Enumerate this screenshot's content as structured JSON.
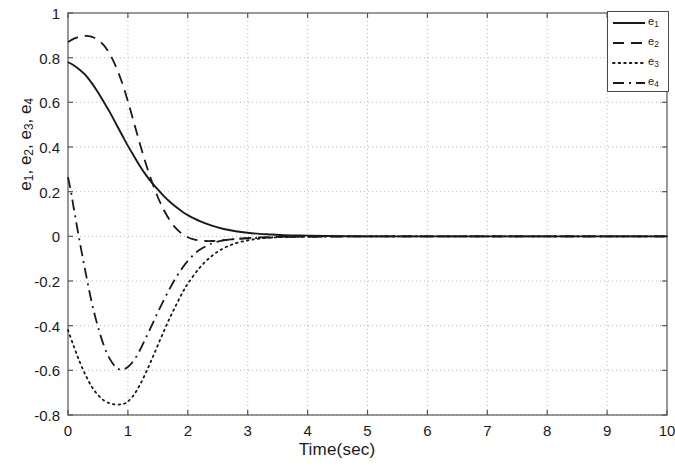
{
  "chart_data": {
    "type": "line",
    "title": "",
    "xlabel": "Time(sec)",
    "ylabel": "e_1, e_2, e_3, e_4",
    "xlim": [
      0,
      10
    ],
    "ylim": [
      -0.8,
      1
    ],
    "xticks": [
      "0",
      "1",
      "2",
      "3",
      "4",
      "5",
      "6",
      "7",
      "8",
      "9",
      "10"
    ],
    "yticks": [
      "1",
      "0.8",
      "0.6",
      "0.4",
      "0.2",
      "0",
      "-0.2",
      "-0.4",
      "-0.6",
      "-0.8"
    ],
    "grid": true,
    "grid_style": "dotted",
    "grid_color": "#b9b9b9",
    "legend_position": "top-right",
    "line_color": "#1a1a1a",
    "series": [
      {
        "name": "e_1",
        "label_base": "e",
        "label_sub": "1",
        "style": "solid",
        "x": [
          0,
          0.1,
          0.2,
          0.3,
          0.4,
          0.5,
          0.6,
          0.7,
          0.8,
          0.9,
          1.0,
          1.1,
          1.2,
          1.3,
          1.4,
          1.5,
          1.6,
          1.7,
          1.8,
          1.9,
          2.0,
          2.2,
          2.4,
          2.6,
          2.8,
          3.0,
          3.2,
          3.4,
          3.6,
          3.8,
          4.0,
          4.5,
          5.0,
          6.0,
          7.0,
          8.0,
          9.0,
          10.0
        ],
        "y": [
          0.78,
          0.765,
          0.745,
          0.72,
          0.685,
          0.645,
          0.6,
          0.555,
          0.505,
          0.455,
          0.405,
          0.36,
          0.315,
          0.275,
          0.24,
          0.21,
          0.18,
          0.155,
          0.132,
          0.112,
          0.095,
          0.068,
          0.048,
          0.033,
          0.023,
          0.016,
          0.011,
          0.008,
          0.005,
          0.004,
          0.003,
          0.001,
          0.0,
          0.0,
          0.0,
          0.0,
          0.0,
          0.0
        ]
      },
      {
        "name": "e_2",
        "label_base": "e",
        "label_sub": "2",
        "style": "dashed",
        "x": [
          0,
          0.1,
          0.2,
          0.3,
          0.4,
          0.5,
          0.6,
          0.7,
          0.8,
          0.9,
          1.0,
          1.1,
          1.2,
          1.3,
          1.4,
          1.5,
          1.6,
          1.7,
          1.8,
          1.9,
          2.0,
          2.1,
          2.2,
          2.3,
          2.4,
          2.5,
          2.6,
          2.8,
          3.0,
          3.2,
          3.5,
          4.0,
          5.0,
          6.0,
          8.0,
          10.0
        ],
        "y": [
          0.87,
          0.885,
          0.895,
          0.898,
          0.893,
          0.88,
          0.855,
          0.815,
          0.76,
          0.69,
          0.605,
          0.51,
          0.415,
          0.325,
          0.245,
          0.175,
          0.118,
          0.072,
          0.037,
          0.012,
          -0.004,
          -0.014,
          -0.019,
          -0.021,
          -0.021,
          -0.019,
          -0.017,
          -0.012,
          -0.008,
          -0.005,
          -0.002,
          -0.001,
          0.0,
          0.0,
          0.0,
          0.0
        ]
      },
      {
        "name": "e_3",
        "label_base": "e",
        "label_sub": "3",
        "style": "dotted",
        "x": [
          0,
          0.1,
          0.2,
          0.3,
          0.4,
          0.5,
          0.6,
          0.7,
          0.8,
          0.9,
          0.95,
          1.0,
          1.1,
          1.2,
          1.3,
          1.4,
          1.5,
          1.6,
          1.7,
          1.8,
          1.9,
          2.0,
          2.2,
          2.4,
          2.6,
          2.8,
          3.0,
          3.2,
          3.5,
          4.0,
          5.0,
          6.0,
          8.0,
          10.0
        ],
        "y": [
          -0.42,
          -0.495,
          -0.565,
          -0.625,
          -0.675,
          -0.71,
          -0.735,
          -0.748,
          -0.753,
          -0.752,
          -0.748,
          -0.74,
          -0.71,
          -0.665,
          -0.61,
          -0.55,
          -0.487,
          -0.425,
          -0.365,
          -0.31,
          -0.258,
          -0.212,
          -0.14,
          -0.088,
          -0.053,
          -0.031,
          -0.018,
          -0.01,
          -0.004,
          -0.001,
          0.0,
          0.0,
          0.0,
          0.0
        ]
      },
      {
        "name": "e_4",
        "label_base": "e",
        "label_sub": "4",
        "style": "dashdot",
        "x": [
          0,
          0.05,
          0.1,
          0.2,
          0.3,
          0.4,
          0.5,
          0.6,
          0.7,
          0.8,
          0.85,
          0.9,
          1.0,
          1.1,
          1.2,
          1.3,
          1.4,
          1.5,
          1.6,
          1.7,
          1.8,
          1.9,
          2.0,
          2.1,
          2.2,
          2.4,
          2.6,
          2.8,
          3.0,
          3.2,
          3.5,
          4.0,
          5.0,
          6.0,
          8.0,
          10.0
        ],
        "y": [
          0.265,
          0.2,
          0.12,
          -0.03,
          -0.17,
          -0.3,
          -0.405,
          -0.49,
          -0.55,
          -0.587,
          -0.595,
          -0.597,
          -0.585,
          -0.555,
          -0.51,
          -0.455,
          -0.398,
          -0.34,
          -0.285,
          -0.233,
          -0.186,
          -0.145,
          -0.11,
          -0.082,
          -0.06,
          -0.032,
          -0.018,
          -0.012,
          -0.009,
          -0.007,
          -0.004,
          -0.002,
          0.0,
          0.0,
          0.0,
          0.0
        ]
      }
    ]
  },
  "legend": {
    "items": [
      {
        "label_base": "e",
        "label_sub": "1",
        "style": "solid"
      },
      {
        "label_base": "e",
        "label_sub": "2",
        "style": "dashed"
      },
      {
        "label_base": "e",
        "label_sub": "3",
        "style": "dotted"
      },
      {
        "label_base": "e",
        "label_sub": "4",
        "style": "dashdot"
      }
    ]
  },
  "axes_geometry": {
    "left": 68,
    "right": 667,
    "top": 13,
    "bottom": 415
  }
}
